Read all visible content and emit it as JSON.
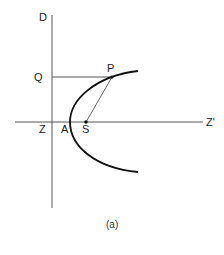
{
  "figure": {
    "caption": "(a)",
    "colors": {
      "background": "#ffffff",
      "lines": "#555555",
      "curve": "#111111",
      "text": "#222222"
    },
    "labels": {
      "directrix_top": "D",
      "foot_of_perpendicular": "Q",
      "directrix_axis_intersection": "Z",
      "vertex": "A",
      "focus": "S",
      "point_on_curve": "P",
      "axis_end": "Z'"
    },
    "elements": {
      "directrix": "vertical line ZD",
      "axis": "horizontal line ZZ'",
      "perpendicular": "segment QP",
      "focal_radius": "segment SP",
      "curve": "parabola with vertex A and focus S"
    }
  }
}
